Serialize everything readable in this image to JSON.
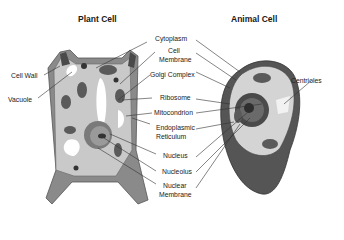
{
  "titles": {
    "plant": "Plant Cell",
    "animal": "Animal Cell"
  },
  "labels": {
    "cell_wall": "Cell Wall",
    "vacuole": "Vacuole",
    "cytoplasm": "Cytoplasm",
    "cell_membrane_1": "Cell",
    "cell_membrane_2": "Membrane",
    "golgi": "Golgi Complex",
    "ribosome": "Ribosome",
    "mitochondrion": "Mitocondrion",
    "er_1": "Endoplasmic",
    "er_2": "Reticulum",
    "nucleus": "Nucleus",
    "nucleolus": "Nucleolus",
    "nuclear_membrane_1": "Nuclear",
    "nuclear_membrane_2": "Membrane",
    "centrioles": "Centrioles"
  },
  "colors": {
    "wall": "#8a8a8a",
    "wall_dark": "#4a4a4a",
    "cytoplasm": "#c9c9c9",
    "organelle": "#5a5a5a",
    "vacuole": "#ffffff",
    "animal_outer": "#555555",
    "animal_inner": "#d4d4d4",
    "nucleus": "#6a6a6a",
    "line": "#333333"
  }
}
